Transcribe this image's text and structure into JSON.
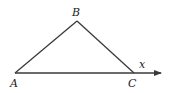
{
  "diagram": {
    "type": "geometry-triangle",
    "stroke_color": "#3a3a3a",
    "points": {
      "A": {
        "label": "A",
        "x": 15,
        "y": 73
      },
      "B": {
        "label": "B",
        "x": 77,
        "y": 21
      },
      "C": {
        "label": "C",
        "x": 134,
        "y": 73
      }
    },
    "ray": {
      "from": "A",
      "through": "C",
      "end_x": 160,
      "label": "x"
    },
    "labels": {
      "A": "A",
      "B": "B",
      "C": "C",
      "x": "x"
    }
  }
}
